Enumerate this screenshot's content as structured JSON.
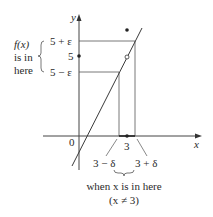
{
  "diagram": {
    "axes": {
      "x_label": "x",
      "y_label": "y",
      "origin_label": "0"
    },
    "y_ticks": {
      "upper": "5 + ε",
      "center": "5",
      "lower": "5 − ε"
    },
    "x_ticks": {
      "center": "3",
      "left": "3 − δ",
      "right": "3 + δ"
    },
    "left_annotation": [
      "f(x)",
      "is in",
      "here"
    ],
    "bottom_annotation": [
      "when x is in here",
      "(x ≠ 3)"
    ],
    "points": {
      "filled_point": "f(3) defined value above line",
      "open_circle": "(3, 5) hole"
    },
    "colors": {
      "line": "#3a3a3a",
      "guide": "#555555",
      "text": "#2a2a2a"
    }
  }
}
